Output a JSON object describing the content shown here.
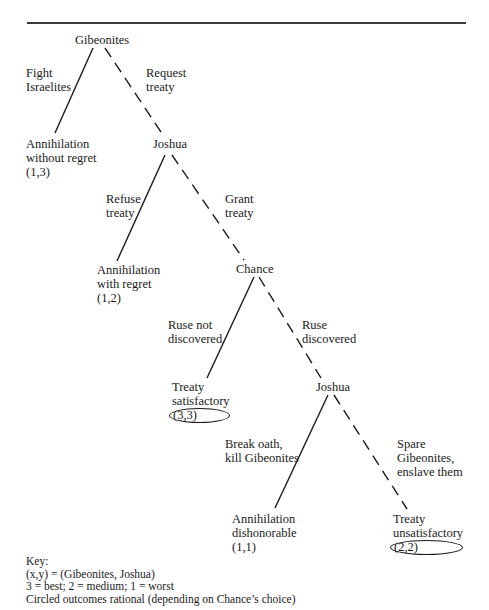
{
  "diagram": {
    "nodes": {
      "gibeonites": {
        "label": "Gibeonites"
      },
      "joshua_1": {
        "label": "Joshua"
      },
      "chance": {
        "label": "Chance"
      },
      "joshua_2": {
        "label": "Joshua"
      }
    },
    "edges": {
      "fight": {
        "line1": "Fight",
        "line2": "Israelites",
        "style": "solid"
      },
      "request": {
        "line1": "Request",
        "line2": "treaty",
        "style": "dashed"
      },
      "refuse": {
        "line1": "Refuse",
        "line2": "treaty",
        "style": "solid"
      },
      "grant": {
        "line1": "Grant",
        "line2": "treaty",
        "style": "dashed"
      },
      "ruse_not": {
        "line1": "Ruse not",
        "line2": "discovered",
        "style": "solid"
      },
      "ruse_disc": {
        "line1": "Ruse",
        "line2": "discovered",
        "style": "dashed"
      },
      "break_oath": {
        "line1": "Break oath,",
        "line2": "kill Gibeonites",
        "style": "solid"
      },
      "spare": {
        "line1": "Spare",
        "line2": "Gibeonites,",
        "line3": "enslave them",
        "style": "dashed"
      }
    },
    "outcomes": {
      "o1": {
        "line1": "Annihilation",
        "line2": "without regret",
        "payoff": "(1,3)",
        "circled": false
      },
      "o2": {
        "line1": "Annihilation",
        "line2": "with regret",
        "payoff": "(1,2)",
        "circled": false
      },
      "o3": {
        "line1": "Treaty",
        "line2": "satisfactory",
        "payoff": "(3,3)",
        "circled": true
      },
      "o4": {
        "line1": "Annihilation",
        "line2": "dishonorable",
        "payoff": "(1,1)",
        "circled": false
      },
      "o5": {
        "line1": "Treaty",
        "line2": "unsatisfactory",
        "payoff": "(2,2)",
        "circled": true
      }
    },
    "key": {
      "title": "Key:",
      "line1": "(x,y) = (Gibeonites, Joshua)",
      "line2": "3 = best; 2 = medium; 1 = worst",
      "line3": "Circled outcomes rational (depending on Chance’s choice)"
    }
  }
}
